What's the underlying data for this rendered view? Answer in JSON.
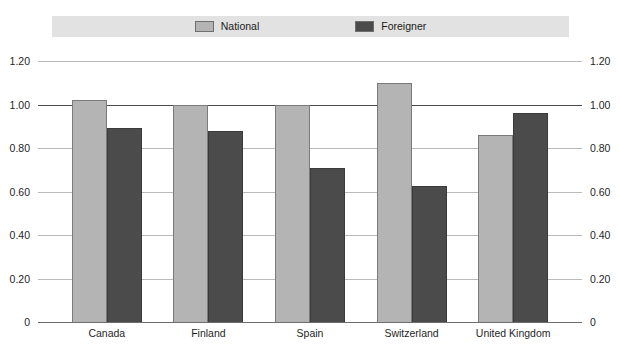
{
  "chart_data": {
    "type": "bar",
    "title": "",
    "subtitle": "",
    "xlabel": "",
    "ylabel": "",
    "categories": [
      "Canada",
      "Finland",
      "Spain",
      "Switzerland",
      "United Kingdom"
    ],
    "series": [
      {
        "name": "National",
        "color": "#b4b4b4",
        "values": [
          1.02,
          1.0,
          1.0,
          1.1,
          0.86
        ]
      },
      {
        "name": "Foreigner",
        "color": "#4b4b4b",
        "values": [
          0.89,
          0.88,
          0.71,
          0.625,
          0.96
        ]
      }
    ],
    "ylim": [
      0,
      1.2
    ],
    "ytick_values": [
      1.2,
      1.0,
      0.8,
      0.6,
      0.4,
      0.2,
      0
    ],
    "ytick_labels": [
      "1.20",
      "1.00",
      "0.80",
      "0.60",
      "0.40",
      "0.20",
      "0"
    ],
    "ytick_labels_right": [
      "1.20",
      "1.00",
      "0.80",
      "0.60",
      "0.40",
      "0.20",
      "0"
    ],
    "grid": true,
    "emphasized_gridlines": [
      1.0
    ],
    "legend_position": "top",
    "legend_background": "#e2e2e2"
  },
  "legend": {
    "entries": [
      {
        "label": "National",
        "swatch_color": "#b4b4b4"
      },
      {
        "label": "Foreigner",
        "swatch_color": "#4b4b4b"
      }
    ]
  },
  "colors": {
    "national": "#b4b4b4",
    "foreigner": "#4b4b4b",
    "gridline": "#b9b9b9",
    "gridline_major": "#4b4b4b",
    "legend_band": "#e2e2e2",
    "background": "#ffffff",
    "text": "#1f1f1f"
  }
}
